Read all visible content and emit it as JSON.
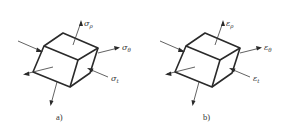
{
  "figure": {
    "panels": [
      {
        "id": "a",
        "caption": "a)",
        "symbol": "σ",
        "labels": [
          {
            "key": "radial",
            "base": "σ",
            "subscript": "ρ"
          },
          {
            "key": "hoop",
            "base": "σ",
            "subscript": "θ"
          },
          {
            "key": "tangential",
            "base": "σ",
            "subscript": "t"
          }
        ]
      },
      {
        "id": "b",
        "caption": "b)",
        "symbol": "ε",
        "labels": [
          {
            "key": "radial",
            "base": "ε",
            "subscript": "ρ"
          },
          {
            "key": "hoop",
            "base": "ε",
            "subscript": "θ"
          },
          {
            "key": "tangential",
            "base": "ε",
            "subscript": "t"
          }
        ]
      }
    ]
  }
}
